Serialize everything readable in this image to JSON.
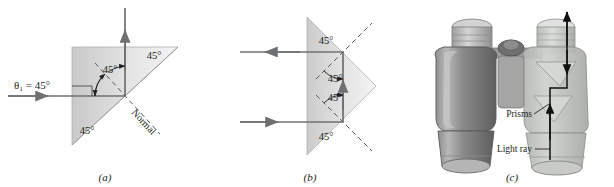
{
  "figure": {
    "kind": "optics-total-internal-reflection-prisms",
    "panels": [
      {
        "id": "a",
        "caption": "(a)",
        "incident_label": "θ₁ = 45°",
        "normal_label": "Normal",
        "angles": [
          {
            "name": "prism-apex-angle-top-right",
            "value": "45°"
          },
          {
            "name": "prism-angle-bottom-left",
            "value": "45°"
          },
          {
            "name": "reflection-angle",
            "value": "45°"
          }
        ]
      },
      {
        "id": "b",
        "caption": "(b)",
        "angles": [
          {
            "name": "prism-angle-top-left",
            "value": "45°"
          },
          {
            "name": "reflection-angle-upper",
            "value": "45°"
          },
          {
            "name": "reflection-angle-lower",
            "value": "45°"
          },
          {
            "name": "prism-angle-bottom-left",
            "value": "45°"
          }
        ]
      },
      {
        "id": "c",
        "caption": "(c)",
        "labels": [
          {
            "name": "prisms",
            "text": "Prisms"
          },
          {
            "name": "light-ray",
            "text": "Light ray"
          }
        ]
      }
    ],
    "colors": {
      "background": "#ffffff",
      "ink": "#231f20",
      "ray": "#6f7072",
      "glass_light": "#f2f2f2",
      "glass_dark": "#c9c9c9",
      "binocular_body": "#7f7f7f",
      "binocular_dark": "#5a5a5a",
      "binocular_light": "#d8d8d8",
      "glass_body": "#c3c5c2"
    }
  }
}
